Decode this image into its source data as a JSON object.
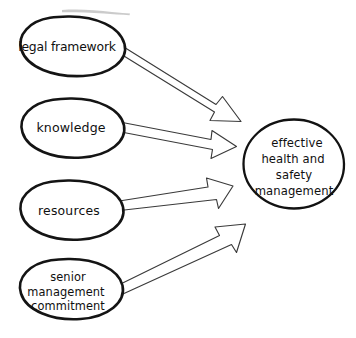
{
  "diagram": {
    "style": "hand-drawn",
    "background_color": "#ffffff",
    "stroke_color": "#141414",
    "arrow_stroke_color": "#3a3a3a",
    "arrow_fill_color": "#ffffff",
    "sources": [
      {
        "id": "legal-framework",
        "label": "legal framework",
        "lines": [
          "legal framework"
        ],
        "shape": "ellipse"
      },
      {
        "id": "knowledge",
        "label": "knowledge",
        "lines": [
          "knowledge"
        ],
        "shape": "ellipse"
      },
      {
        "id": "resources",
        "label": "resources",
        "lines": [
          "resources"
        ],
        "shape": "ellipse"
      },
      {
        "id": "senior-management-commitment",
        "label": "senior management commitment",
        "lines": [
          "senior",
          "management",
          "commitment"
        ],
        "shape": "ellipse"
      }
    ],
    "target": {
      "id": "effective-health-and-safety-management",
      "label": "effective health and safety management",
      "lines": [
        "effective",
        "health and",
        "safety",
        "management"
      ],
      "shape": "circle"
    },
    "connectors": [
      {
        "id": "arrow-legal-framework",
        "from": "legal framework",
        "to": "effective health and safety management",
        "style": "hollow-block-arrow"
      },
      {
        "id": "arrow-knowledge",
        "from": "knowledge",
        "to": "effective health and safety management",
        "style": "hollow-block-arrow"
      },
      {
        "id": "arrow-resources",
        "from": "resources",
        "to": "effective health and safety management",
        "style": "hollow-block-arrow"
      },
      {
        "id": "arrow-senior-management-commitment",
        "from": "senior management commitment",
        "to": "effective health and safety management",
        "style": "hollow-block-arrow"
      }
    ]
  }
}
